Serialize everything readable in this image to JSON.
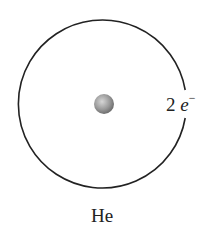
{
  "diagram": {
    "element_label": "He",
    "electron_count": "2",
    "electron_symbol": "e",
    "electron_charge": "−",
    "shells": [
      {
        "radius": 84,
        "electrons": 2
      }
    ],
    "colors": {
      "orbit": "#222222",
      "nucleus_light": "#d0d0d0",
      "nucleus_dark": "#6f6f6f",
      "text": "#222222"
    }
  }
}
